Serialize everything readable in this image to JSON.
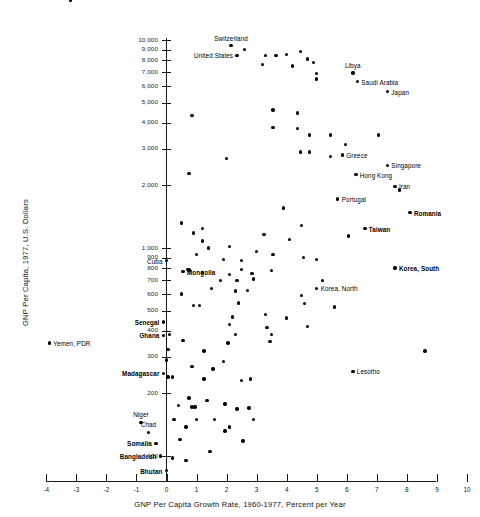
{
  "chart_data": {
    "type": "scatter",
    "title": "",
    "xlabel": "GNP Per Capita Growth Rate, 1960-1977, Percent per Year",
    "ylabel": "GNP Per Capita, 1977, U.S. Dollars",
    "xlim": [
      -4,
      10
    ],
    "ylim": [
      80,
      11000
    ],
    "yscale": "log",
    "xscale": "linear",
    "grid": false,
    "legend": "none",
    "xticks": [
      "-4",
      "-3",
      "-2",
      "-1",
      "0",
      "1",
      "2",
      "3",
      "4",
      "5",
      "6",
      "7",
      "8",
      "9",
      "10"
    ],
    "xtick_values": [
      -4,
      -3,
      -2,
      -1,
      0,
      1,
      2,
      3,
      4,
      5,
      6,
      7,
      8,
      9,
      10
    ],
    "yticks": [
      "10,000",
      "9,000",
      "8,000",
      "7,000",
      "6,000",
      "5,000",
      "4,000",
      "3,000",
      "2,000",
      "1,000",
      "900",
      "800",
      "700",
      "600",
      "500",
      "400",
      "300",
      "200",
      "100"
    ],
    "ytick_values": [
      10000,
      9000,
      8000,
      7000,
      6000,
      5000,
      4000,
      3000,
      2000,
      1000,
      900,
      800,
      700,
      600,
      500,
      400,
      300,
      200,
      100
    ],
    "labeled_points": [
      {
        "name": "Kuwait",
        "x": -3.2,
        "y": 15500,
        "pos": "above",
        "bold": false
      },
      {
        "name": "Switzerland",
        "x": 2.15,
        "y": 9400,
        "pos": "above",
        "bold": false
      },
      {
        "name": "United States",
        "x": 2.35,
        "y": 8450,
        "pos": "left",
        "bold": false
      },
      {
        "name": "Libya",
        "x": 6.2,
        "y": 6950,
        "pos": "above",
        "bold": false
      },
      {
        "name": "Saudi Arabia",
        "x": 6.35,
        "y": 6300,
        "pos": "right",
        "bold": false
      },
      {
        "name": "Japan",
        "x": 7.35,
        "y": 5650,
        "pos": "right",
        "bold": false
      },
      {
        "name": "Greece",
        "x": 5.85,
        "y": 2800,
        "pos": "right",
        "bold": false
      },
      {
        "name": "Singapore",
        "x": 7.35,
        "y": 2500,
        "pos": "right",
        "bold": false
      },
      {
        "name": "Hong Kong",
        "x": 6.3,
        "y": 2250,
        "pos": "right",
        "bold": false
      },
      {
        "name": "Iran",
        "x": 7.6,
        "y": 1980,
        "pos": "right",
        "bold": false
      },
      {
        "name": "Portugal",
        "x": 5.7,
        "y": 1720,
        "pos": "right",
        "bold": false
      },
      {
        "name": "Romania",
        "x": 8.1,
        "y": 1480,
        "pos": "right",
        "bold": true
      },
      {
        "name": "Taiwan",
        "x": 6.6,
        "y": 1240,
        "pos": "right",
        "bold": true
      },
      {
        "name": "Cuba",
        "x": 0.0,
        "y": 870,
        "pos": "left",
        "bold": false
      },
      {
        "name": "Korea, South",
        "x": 7.6,
        "y": 800,
        "pos": "right",
        "bold": true
      },
      {
        "name": "Mongolia",
        "x": 0.55,
        "y": 770,
        "pos": "right",
        "bold": true
      },
      {
        "name": "Korea, North",
        "x": 5.0,
        "y": 640,
        "pos": "right",
        "bold": false
      },
      {
        "name": "Senegal",
        "x": -0.1,
        "y": 440,
        "pos": "left",
        "bold": true
      },
      {
        "name": "Ghana",
        "x": -0.1,
        "y": 380,
        "pos": "left",
        "bold": true
      },
      {
        "name": "Yemen, PDR",
        "x": -3.9,
        "y": 350,
        "pos": "right",
        "bold": false
      },
      {
        "name": "Madagascar",
        "x": -0.1,
        "y": 250,
        "pos": "left",
        "bold": true
      },
      {
        "name": "Lesotho",
        "x": 6.2,
        "y": 255,
        "pos": "right",
        "bold": false
      },
      {
        "name": "Niger",
        "x": -0.85,
        "y": 145,
        "pos": "above",
        "bold": false
      },
      {
        "name": "Chad",
        "x": -0.6,
        "y": 130,
        "pos": "above",
        "bold": false
      },
      {
        "name": "Somalia",
        "x": -0.35,
        "y": 115,
        "pos": "left",
        "bold": true
      },
      {
        "name": "Bangladesh",
        "x": -0.2,
        "y": 100,
        "pos": "left",
        "bold": true
      },
      {
        "name": "Bhutan",
        "x": 0.0,
        "y": 85,
        "pos": "left",
        "bold": true
      }
    ],
    "unlabeled_points": [
      {
        "x": 2.6,
        "y": 9000
      },
      {
        "x": 3.3,
        "y": 8450
      },
      {
        "x": 3.65,
        "y": 8450
      },
      {
        "x": 4.0,
        "y": 8500
      },
      {
        "x": 4.45,
        "y": 8800
      },
      {
        "x": 3.2,
        "y": 7600
      },
      {
        "x": 4.2,
        "y": 7500
      },
      {
        "x": 4.7,
        "y": 8100
      },
      {
        "x": 4.9,
        "y": 7800
      },
      {
        "x": 5.0,
        "y": 6900
      },
      {
        "x": 5.0,
        "y": 6500
      },
      {
        "x": 0.85,
        "y": 4350
      },
      {
        "x": 3.55,
        "y": 4600
      },
      {
        "x": 4.35,
        "y": 4450
      },
      {
        "x": 3.55,
        "y": 3800
      },
      {
        "x": 4.35,
        "y": 3750
      },
      {
        "x": 4.75,
        "y": 3500
      },
      {
        "x": 5.45,
        "y": 3500
      },
      {
        "x": 7.05,
        "y": 3500
      },
      {
        "x": 5.95,
        "y": 3150
      },
      {
        "x": 4.45,
        "y": 2900
      },
      {
        "x": 4.75,
        "y": 2900
      },
      {
        "x": 5.45,
        "y": 2750
      },
      {
        "x": 2.0,
        "y": 2700
      },
      {
        "x": 0.75,
        "y": 2280
      },
      {
        "x": 7.75,
        "y": 1900
      },
      {
        "x": 3.9,
        "y": 1560
      },
      {
        "x": 0.5,
        "y": 1320
      },
      {
        "x": 4.5,
        "y": 1280
      },
      {
        "x": 1.2,
        "y": 1240
      },
      {
        "x": 0.9,
        "y": 1180
      },
      {
        "x": 3.25,
        "y": 1160
      },
      {
        "x": 6.05,
        "y": 1140
      },
      {
        "x": 1.2,
        "y": 1080
      },
      {
        "x": 4.1,
        "y": 1100
      },
      {
        "x": 1.4,
        "y": 1000
      },
      {
        "x": 2.1,
        "y": 1020
      },
      {
        "x": 3.0,
        "y": 960
      },
      {
        "x": 1.0,
        "y": 930
      },
      {
        "x": 3.55,
        "y": 930
      },
      {
        "x": 4.55,
        "y": 900
      },
      {
        "x": 1.9,
        "y": 880
      },
      {
        "x": 2.5,
        "y": 870
      },
      {
        "x": 5.0,
        "y": 880
      },
      {
        "x": 0.7,
        "y": 790
      },
      {
        "x": 0.75,
        "y": 785
      },
      {
        "x": 1.2,
        "y": 760
      },
      {
        "x": 2.1,
        "y": 745
      },
      {
        "x": 2.5,
        "y": 790
      },
      {
        "x": 2.85,
        "y": 755
      },
      {
        "x": 3.5,
        "y": 780
      },
      {
        "x": 1.8,
        "y": 700
      },
      {
        "x": 2.35,
        "y": 700
      },
      {
        "x": 2.9,
        "y": 710
      },
      {
        "x": 5.2,
        "y": 700
      },
      {
        "x": 1.5,
        "y": 640
      },
      {
        "x": 2.3,
        "y": 620
      },
      {
        "x": 2.7,
        "y": 625
      },
      {
        "x": 0.5,
        "y": 600
      },
      {
        "x": 4.5,
        "y": 590
      },
      {
        "x": 0.9,
        "y": 530
      },
      {
        "x": 1.1,
        "y": 530
      },
      {
        "x": 2.4,
        "y": 545
      },
      {
        "x": 4.6,
        "y": 540
      },
      {
        "x": 5.6,
        "y": 520
      },
      {
        "x": 3.3,
        "y": 480
      },
      {
        "x": 2.2,
        "y": 465
      },
      {
        "x": 4.0,
        "y": 460
      },
      {
        "x": 2.1,
        "y": 430
      },
      {
        "x": 3.35,
        "y": 415
      },
      {
        "x": 4.7,
        "y": 420
      },
      {
        "x": 2.3,
        "y": 385
      },
      {
        "x": 3.5,
        "y": 385
      },
      {
        "x": 0.1,
        "y": 385
      },
      {
        "x": 0.55,
        "y": 360
      },
      {
        "x": 3.45,
        "y": 355
      },
      {
        "x": 2.05,
        "y": 350
      },
      {
        "x": 0.05,
        "y": 325
      },
      {
        "x": 1.25,
        "y": 320
      },
      {
        "x": 8.6,
        "y": 320
      },
      {
        "x": 0.0,
        "y": 290
      },
      {
        "x": 1.9,
        "y": 285
      },
      {
        "x": 0.85,
        "y": 270
      },
      {
        "x": 1.55,
        "y": 262
      },
      {
        "x": 0.05,
        "y": 240
      },
      {
        "x": 0.2,
        "y": 240
      },
      {
        "x": 1.25,
        "y": 235
      },
      {
        "x": 2.8,
        "y": 235
      },
      {
        "x": 0.75,
        "y": 190
      },
      {
        "x": 1.35,
        "y": 185
      },
      {
        "x": 0.4,
        "y": 175
      },
      {
        "x": 0.85,
        "y": 172
      },
      {
        "x": 0.95,
        "y": 172
      },
      {
        "x": 1.95,
        "y": 178
      },
      {
        "x": 2.75,
        "y": 170
      },
      {
        "x": 0.25,
        "y": 150
      },
      {
        "x": 1.0,
        "y": 150
      },
      {
        "x": 1.6,
        "y": 150
      },
      {
        "x": 0.65,
        "y": 138
      },
      {
        "x": 2.1,
        "y": 138
      },
      {
        "x": 2.9,
        "y": 150
      },
      {
        "x": 0.45,
        "y": 120
      },
      {
        "x": 2.55,
        "y": 118
      },
      {
        "x": 1.45,
        "y": 105
      },
      {
        "x": 0.2,
        "y": 98
      },
      {
        "x": 0.65,
        "y": 95
      },
      {
        "x": 1.95,
        "y": 132
      },
      {
        "x": 2.35,
        "y": 168
      },
      {
        "x": 2.5,
        "y": 230
      }
    ]
  },
  "figure": {
    "background": "#ffffff",
    "point_color": "#000000",
    "axis_color": "#1a1a1a"
  }
}
